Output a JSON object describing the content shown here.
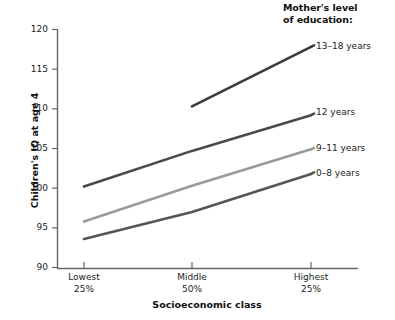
{
  "legend": {
    "title_line1": "Mother's level",
    "title_line2": "of education:",
    "entries": [
      {
        "label": "13–18 years",
        "color": "#3b3b3b"
      },
      {
        "label": "12 years",
        "color": "#4a4a4a"
      },
      {
        "label": "9–11 years",
        "color": "#9a9a9a"
      },
      {
        "label": "0–8 years",
        "color": "#555555"
      }
    ]
  },
  "axes": {
    "y_title": "Children's IQ at age 4",
    "x_title": "Socioeconomic class",
    "y_ticks": [
      "120",
      "115",
      "110",
      "105",
      "100",
      "95",
      "90"
    ],
    "x_ticks": [
      {
        "line1": "Lowest",
        "line2": "25%"
      },
      {
        "line1": "Middle",
        "line2": "50%"
      },
      {
        "line1": "Highest",
        "line2": "25%"
      }
    ]
  },
  "chart_data": {
    "type": "line",
    "title": "",
    "xlabel": "Socioeconomic class",
    "ylabel": "Children's IQ at age 4",
    "categories": [
      "Lowest 25%",
      "Middle 50%",
      "Highest 25%"
    ],
    "ylim": [
      90,
      120
    ],
    "ytick_values": [
      90,
      95,
      100,
      105,
      110,
      115,
      120
    ],
    "grid": false,
    "legend_position": "right-inline",
    "legend_title": "Mother's level of education:",
    "series": [
      {
        "name": "13–18 years",
        "color": "#3b3b3b",
        "values": [
          null,
          110.3,
          117.8
        ]
      },
      {
        "name": "12 years",
        "color": "#4a4a4a",
        "values": [
          100.2,
          104.7,
          109.2
        ]
      },
      {
        "name": "9–11 years",
        "color": "#9a9a9a",
        "values": [
          95.8,
          100.3,
          104.9
        ]
      },
      {
        "name": "0–8 years",
        "color": "#555555",
        "values": [
          93.6,
          97.0,
          101.8
        ]
      }
    ]
  }
}
